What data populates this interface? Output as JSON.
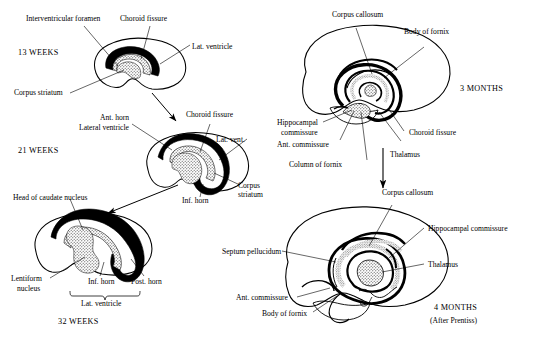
{
  "figure": {
    "attribution": "(After Prentiss)",
    "signature": "artist-signature"
  },
  "panels": [
    {
      "id": "13-weeks",
      "stage": "13 WEEKS",
      "labels": [
        {
          "name": "interventricular-foramen",
          "text": "Interventricular foramen"
        },
        {
          "name": "choroid-fissure",
          "text": "Choroid fissure"
        },
        {
          "name": "lat-ventricle",
          "text": "Lat. ventricle"
        },
        {
          "name": "corpus-striatum",
          "text": "Corpus striatum"
        }
      ]
    },
    {
      "id": "21-weeks",
      "stage": "21 WEEKS",
      "labels": [
        {
          "name": "ant-horn",
          "text": "Ant. horn"
        },
        {
          "name": "lateral-ventricle",
          "text": "Lateral ventricle"
        },
        {
          "name": "choroid-fissure",
          "text": "Choroid fissure"
        },
        {
          "name": "lat-vent",
          "text": "Lat. vent."
        },
        {
          "name": "corpus-striatum-line1",
          "text": "Corpus"
        },
        {
          "name": "corpus-striatum-line2",
          "text": "striatum"
        },
        {
          "name": "inf-horn",
          "text": "Inf. horn"
        }
      ]
    },
    {
      "id": "32-weeks",
      "stage": "32 WEEKS",
      "labels": [
        {
          "name": "head-of-caudate-nucleus",
          "text": "Head of caudate nucleus"
        },
        {
          "name": "lentiform-nucleus-line1",
          "text": "Lentiform"
        },
        {
          "name": "lentiform-nucleus-line2",
          "text": "nucleus"
        },
        {
          "name": "inf-horn",
          "text": "Inf. horn"
        },
        {
          "name": "post-horn",
          "text": "Post. horn"
        },
        {
          "name": "lat-ventricle-brace",
          "text": "Lat. ventricle"
        }
      ]
    },
    {
      "id": "3-months",
      "stage": "3 MONTHS",
      "labels": [
        {
          "name": "corpus-callosum",
          "text": "Corpus callosum"
        },
        {
          "name": "body-of-fornix",
          "text": "Body of fornix"
        },
        {
          "name": "hippocampal-commissure-line1",
          "text": "Hippocampal"
        },
        {
          "name": "hippocampal-commissure-line2",
          "text": "commissure"
        },
        {
          "name": "choroid-fissure",
          "text": "Choroid fissure"
        },
        {
          "name": "ant-commissure",
          "text": "Ant. commissure"
        },
        {
          "name": "thalamus",
          "text": "Thalamus"
        },
        {
          "name": "column-of-fornix",
          "text": "Column of fornix"
        }
      ]
    },
    {
      "id": "4-months",
      "stage": "4 MONTHS",
      "sub": "(After Prentiss)",
      "labels": [
        {
          "name": "corpus-callosum",
          "text": "Corpus callosum"
        },
        {
          "name": "hippocampal-commissure",
          "text": "Hippocampal commissure"
        },
        {
          "name": "thalamus",
          "text": "Thalamus"
        },
        {
          "name": "septum-pellucidum",
          "text": "Septum pellucidum"
        },
        {
          "name": "ant-commissure",
          "text": "Ant. commissure"
        },
        {
          "name": "body-of-fornix",
          "text": "Body of fornix"
        }
      ]
    }
  ],
  "colors": {
    "ink": "#000000",
    "paper": "#ffffff",
    "stipple": "#3a3a3a"
  }
}
